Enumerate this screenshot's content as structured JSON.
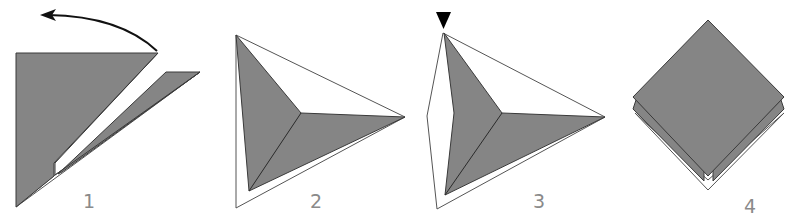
{
  "diagram": {
    "type": "origami-fold-sequence",
    "colors": {
      "paper_colored_side": "#858585",
      "paper_white_side": "#ffffff",
      "outline": "#3a3a3a",
      "label": "#8a8a8a",
      "arrow": "#111111"
    },
    "steps": [
      {
        "number": "1",
        "label": "1",
        "symbol": "fold-arrow-left",
        "description": "Fold top layer back over to the left"
      },
      {
        "number": "2",
        "label": "2",
        "symbol": "none",
        "description": "Result: kite shape with flaps"
      },
      {
        "number": "3",
        "label": "3",
        "symbol": "push-triangle-marker",
        "description": "Push in at top point"
      },
      {
        "number": "4",
        "label": "4",
        "symbol": "none",
        "description": "Finished diamond with layered base"
      }
    ]
  }
}
